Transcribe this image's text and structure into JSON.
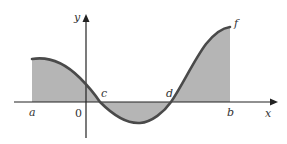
{
  "diagram": {
    "type": "area under curve (signed area)",
    "colors": {
      "fill": "#b5b5b5",
      "curve": "#4a4a4a",
      "axes": "#222222",
      "background": "#ffffff"
    },
    "labels": {
      "y_axis": "y",
      "x_axis": "x",
      "origin": "0",
      "a": "a",
      "b": "b",
      "c": "c",
      "d": "d",
      "f": "f"
    }
  }
}
